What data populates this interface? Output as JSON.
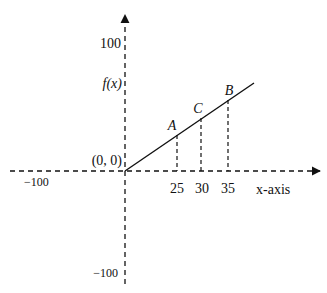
{
  "figure": {
    "y_axis_top_label": "100",
    "y_axis_bottom_label": "−100",
    "x_axis_left_label": "−100",
    "y_function_label": "f(x)",
    "origin_label": "(0, 0)",
    "x_axis_label": "x-axis",
    "x_ticks": [
      "25",
      "30",
      "35"
    ],
    "points": [
      {
        "name": "A",
        "x": "25"
      },
      {
        "name": "C",
        "x": "30"
      },
      {
        "name": "B",
        "x": "35"
      }
    ],
    "colors": {
      "stroke": "#111111",
      "background": "#ffffff"
    }
  }
}
